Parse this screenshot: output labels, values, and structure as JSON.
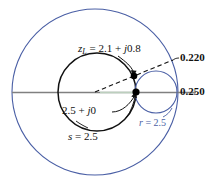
{
  "figure": {
    "kind": "smith-chart-construction",
    "width": 218,
    "height": 185,
    "colors": {
      "outer_circle": "#4a5fa5",
      "small_circle": "#4a5fa5",
      "constant_s_circle": "#111111",
      "axis": "#808080",
      "dashed_line": "#111111",
      "marker": "#000000",
      "blue_text": "#4a5fa5",
      "black_text": "#111111",
      "background": "#ffffff"
    },
    "geometry": {
      "center": {
        "x": 95,
        "y": 92
      },
      "outer_circle": {
        "cx": 95,
        "cy": 92,
        "r": 83
      },
      "constant_s_circle": {
        "cx": 97,
        "cy": 92,
        "r": 39
      },
      "constant_r_circle": {
        "cx": 156,
        "cy": 92,
        "r": 21
      },
      "axis_line": {
        "x1": 12,
        "y1": 92,
        "x2": 196,
        "y2": 92
      },
      "radial_dashed_line": {
        "x1": 95,
        "y1": 92,
        "x2": 173,
        "y2": 60
      },
      "marker_zl": {
        "x": 134,
        "y": 76
      },
      "marker_real": {
        "x": 136,
        "y": 92
      }
    }
  },
  "labels": {
    "load_impedance": {
      "symbol": "z",
      "subscript": "L",
      "equals": " = 2.1 + ",
      "imag_unit": "j",
      "imag_value": "0.8",
      "full_text": "zL = 2.1 + j0.8"
    },
    "wavelength_upper": "0.220",
    "wavelength_lower": "0.250",
    "real_impedance": {
      "value": "2.5 + ",
      "imag_unit": "j",
      "imag_value": "0",
      "full_text": "2.5 + j0"
    },
    "swr_circle": {
      "symbol": "s",
      "equals": " = 2.5",
      "full_text": "s = 2.5"
    },
    "resistance_circle": {
      "symbol": "r",
      "equals": " = 2.5",
      "full_text": "r = 2.5"
    }
  }
}
